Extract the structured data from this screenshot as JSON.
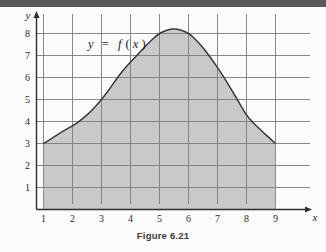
{
  "figure": {
    "caption": "Figure 6.21",
    "function_label": "y = f(x)",
    "function_label_parts": {
      "y": "y",
      "equals": "=",
      "f": "f",
      "open": "(",
      "x": "x",
      "close": ")"
    },
    "axis_labels": {
      "x": "x",
      "y": "y"
    },
    "colors": {
      "shade_fill": "#c9c9c9",
      "curve": "#3a3a3a",
      "grid": "#7a7a7a",
      "axis": "#2f2f2f",
      "scan_bar": "#5a5a5a",
      "page": "#fdfdfd"
    }
  },
  "chart_data": {
    "type": "area",
    "title": "Figure 6.21",
    "xlabel": "x",
    "ylabel": "y",
    "xlim": [
      0,
      9.6
    ],
    "ylim": [
      0,
      8.8
    ],
    "xticks": [
      1,
      2,
      3,
      4,
      5,
      6,
      7,
      8,
      9
    ],
    "yticks": [
      1,
      2,
      3,
      4,
      5,
      6,
      7,
      8
    ],
    "xtick_labels": [
      "1",
      "2",
      "3",
      "4",
      "5",
      "6",
      "7",
      "8",
      "9"
    ],
    "ytick_labels": [
      "1",
      "2",
      "3",
      "4",
      "5",
      "6",
      "7",
      "8"
    ],
    "grid": true,
    "legend": false,
    "annotations": [
      {
        "text": "y = f(x)",
        "x": 3.0,
        "y": 7.55
      }
    ],
    "series": [
      {
        "name": "y = f(x)",
        "type": "line",
        "fill_to": 0,
        "fill_domain": [
          1,
          9
        ],
        "x": [
          1.0,
          1.25,
          1.5,
          1.75,
          2.0,
          2.25,
          2.5,
          2.75,
          3.0,
          3.25,
          3.5,
          3.75,
          4.0,
          4.25,
          4.5,
          4.75,
          5.0,
          5.25,
          5.5,
          5.75,
          6.0,
          6.25,
          6.5,
          6.75,
          7.0,
          7.25,
          7.5,
          7.75,
          8.0,
          8.25,
          8.5,
          8.75,
          9.0
        ],
        "y": [
          3.0,
          3.2,
          3.42,
          3.62,
          3.8,
          4.03,
          4.3,
          4.63,
          5.0,
          5.43,
          5.9,
          6.33,
          6.7,
          7.05,
          7.4,
          7.73,
          8.0,
          8.15,
          8.2,
          8.15,
          8.0,
          7.72,
          7.35,
          6.92,
          6.45,
          5.95,
          5.4,
          4.85,
          4.3,
          3.92,
          3.6,
          3.3,
          3.0
        ]
      }
    ],
    "shaded_region": {
      "description": "region under curve from x=1 to x=9 down to the x-axis",
      "x_from": 1,
      "x_to": 9,
      "y_from": 0
    },
    "endpoints": [
      {
        "x": 1,
        "y": 3
      },
      {
        "x": 9,
        "y": 3
      }
    ],
    "maximum": {
      "x": 5.5,
      "y": 8.2
    }
  }
}
